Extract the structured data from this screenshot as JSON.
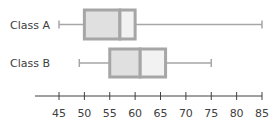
{
  "chart_data": {
    "type": "boxplot",
    "title": "",
    "xlabel": "",
    "ylabel": "",
    "orientation": "horizontal",
    "xlim": [
      45,
      85
    ],
    "ticks": [
      45,
      50,
      55,
      60,
      65,
      70,
      75,
      80,
      85
    ],
    "grid": false,
    "legend": null,
    "series": [
      {
        "name": "Class A",
        "min": 45,
        "q1": 50,
        "median": 57,
        "q3": 60,
        "max": 85
      },
      {
        "name": "Class B",
        "min": 49,
        "q1": 55,
        "median": 61,
        "q3": 66,
        "max": 75
      }
    ]
  },
  "colors": {
    "box_border": "#a6a6a6",
    "lower_fill": "#e0e0e0",
    "upper_fill": "#f2f2f2",
    "whisker": "#a6a6a6",
    "axis": "#404040",
    "text": "#404040"
  }
}
